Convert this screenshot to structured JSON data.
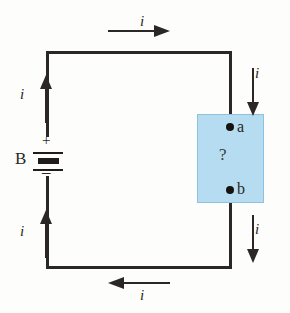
{
  "diagram": {
    "type": "electric-circuit-schematic",
    "title": "",
    "battery": {
      "label": "B",
      "positive_sign": "+",
      "negative_sign": "–",
      "position": "left-branch"
    },
    "mystery_box": {
      "fill_color": "#b5dcf0",
      "border_color": "#8fc3dd",
      "content_label": "?",
      "terminals": [
        {
          "name": "a",
          "label": "a",
          "position": "top"
        },
        {
          "name": "b",
          "label": "b",
          "position": "bottom"
        }
      ]
    },
    "current_arrows": [
      {
        "id": "top",
        "label": "i",
        "direction": "right"
      },
      {
        "id": "right-upper",
        "label": "i",
        "direction": "down"
      },
      {
        "id": "right-lower",
        "label": "i",
        "direction": "down"
      },
      {
        "id": "bottom",
        "label": "i",
        "direction": "left"
      },
      {
        "id": "left-lower",
        "label": "i",
        "direction": "up"
      },
      {
        "id": "left-upper",
        "label": "i",
        "direction": "up"
      }
    ],
    "wire_color": "#2b2724"
  }
}
